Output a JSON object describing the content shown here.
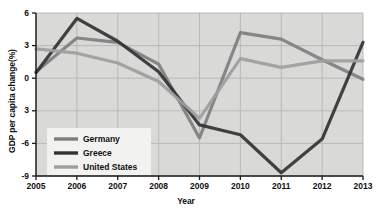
{
  "chart_data": {
    "type": "line",
    "title": "",
    "xlabel": "Year",
    "ylabel": "GDP per capita change(%)",
    "x": [
      2005,
      2006,
      2007,
      2008,
      2009,
      2010,
      2011,
      2012,
      2013
    ],
    "xticklabels": [
      "2005",
      "2006",
      "2007",
      "2008",
      "2009",
      "2010",
      "2011",
      "2012",
      "2013"
    ],
    "yticks": [
      6,
      3,
      0,
      -3,
      -6,
      -9
    ],
    "yticklabels": [
      "6",
      "3",
      "0",
      "3",
      "-6",
      "-9"
    ],
    "ylim": [
      -9,
      6
    ],
    "xlim": [
      2005,
      2013
    ],
    "grid": true,
    "legend_position": "lower-left",
    "series": [
      {
        "name": "Germany",
        "color": "#7f7f7f",
        "values": [
          0.6,
          3.7,
          3.3,
          1.3,
          -5.5,
          4.2,
          3.6,
          1.7,
          -0.1
        ]
      },
      {
        "name": "Greece",
        "color": "#333333",
        "values": [
          0.5,
          5.5,
          3.4,
          0.6,
          -4.3,
          -5.2,
          -8.7,
          -5.6,
          3.3
        ]
      },
      {
        "name": "United States",
        "color": "#9e9e9e",
        "values": [
          2.7,
          2.3,
          1.4,
          -0.3,
          -3.7,
          1.8,
          1.0,
          1.6,
          1.6
        ]
      }
    ]
  },
  "legend": {
    "items": [
      {
        "label": "Germany",
        "color": "#7f7f7f"
      },
      {
        "label": "Greece",
        "color": "#333333"
      },
      {
        "label": "United States",
        "color": "#9e9e9e"
      }
    ]
  },
  "style": {
    "plot_background": "#d9d9d7",
    "grid_color": "#b6b6b3",
    "axis_color": "#1a1a1a",
    "legend_background": "#f2f2f0",
    "page_background": "#ffffff"
  }
}
